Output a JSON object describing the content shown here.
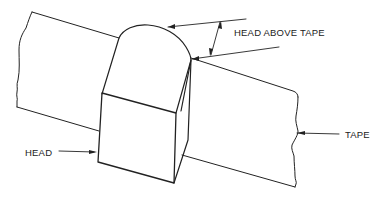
{
  "diagram": {
    "labels": {
      "head_above_tape": "HEAD ABOVE TAPE",
      "tape": "TAPE",
      "head": "HEAD"
    },
    "colors": {
      "line": "#222222",
      "background": "#ffffff"
    }
  }
}
